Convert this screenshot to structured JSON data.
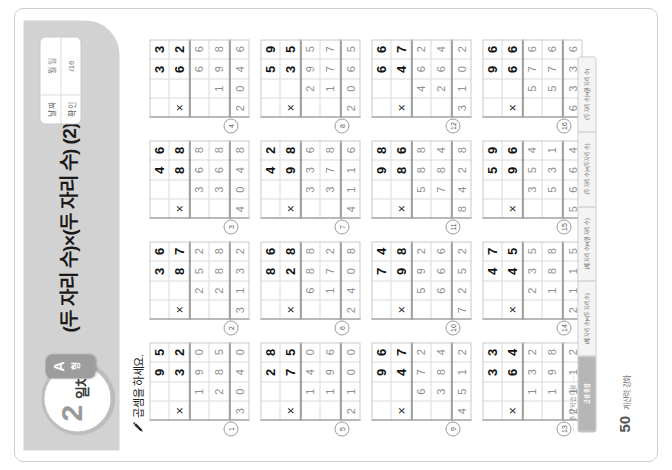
{
  "document": {
    "title": "(두 자리 수)×(두 자리 수) (2)",
    "day_number": "2",
    "day_word": "일차",
    "badge_letter": "A",
    "badge_type": "형",
    "instruction": "곱셈을 하세요.",
    "pencil_icon": "pencil-icon",
    "multiply_symbol": "×"
  },
  "score_box": {
    "rows": [
      {
        "label": "날 짜",
        "value": "월   일"
      },
      {
        "label": "확 인",
        "value": "/16"
      }
    ]
  },
  "side_strip": {
    "note": "······ 주차 학습 내용 ······",
    "tabs": [
      {
        "label": "(두 자리 수)×(한 자리 수)",
        "state": "plain"
      },
      {
        "label": "(두 자리 수)×(두 자리 수)",
        "state": "plain"
      },
      {
        "label": "(세 자리 수)×(한 자리 수)",
        "state": "plain"
      },
      {
        "label": "(세 자리 수)×(두 자리 수)",
        "state": "plain"
      },
      {
        "label": "곱셈 종합",
        "state": "active"
      }
    ]
  },
  "footer": {
    "page_number": "50",
    "label": "계산력 강화"
  },
  "problem_set": {
    "columns": 4,
    "rows": 4,
    "cell_columns": 4,
    "cell_rows": 5,
    "problems": [
      {
        "n": "1",
        "top": "95",
        "bottom": "32",
        "partial1": "190",
        "partial2": "285",
        "result": "3040"
      },
      {
        "n": "2",
        "top": "36",
        "bottom": "87",
        "partial1": "252",
        "partial2": "288",
        "result": "3132"
      },
      {
        "n": "3",
        "top": "46",
        "bottom": "88",
        "partial1": "368",
        "partial2": "368",
        "result": "4048"
      },
      {
        "n": "4",
        "top": "33",
        "bottom": "62",
        "partial1": "66",
        "partial2": "198",
        "result": "2046"
      },
      {
        "n": "5",
        "top": "28",
        "bottom": "75",
        "partial1": "140",
        "partial2": "196",
        "result": "2100"
      },
      {
        "n": "6",
        "top": "86",
        "bottom": "28",
        "partial1": "688",
        "partial2": "172",
        "result": "2408"
      },
      {
        "n": "7",
        "top": "42",
        "bottom": "98",
        "partial1": "336",
        "partial2": "378",
        "result": "4116"
      },
      {
        "n": "8",
        "top": "59",
        "bottom": "35",
        "partial1": "295",
        "partial2": "177",
        "result": "2065"
      },
      {
        "n": "9",
        "top": "96",
        "bottom": "47",
        "partial1": "672",
        "partial2": "384",
        "result": "4512"
      },
      {
        "n": "10",
        "top": "74",
        "bottom": "98",
        "partial1": "592",
        "partial2": "666",
        "result": "7252"
      },
      {
        "n": "11",
        "top": "98",
        "bottom": "86",
        "partial1": "588",
        "partial2": "784",
        "result": "8428"
      },
      {
        "n": "12",
        "top": "66",
        "bottom": "47",
        "partial1": "462",
        "partial2": "264",
        "result": "3102"
      },
      {
        "n": "13",
        "top": "33",
        "bottom": "64",
        "partial1": "132",
        "partial2": "198",
        "result": "2112"
      },
      {
        "n": "14",
        "top": "47",
        "bottom": "45",
        "partial1": "235",
        "partial2": "188",
        "result": "2115"
      },
      {
        "n": "15",
        "top": "59",
        "bottom": "96",
        "partial1": "354",
        "partial2": "531",
        "result": "5664"
      },
      {
        "n": "16",
        "top": "96",
        "bottom": "66",
        "partial1": "576",
        "partial2": "576",
        "result": "6336"
      }
    ]
  }
}
